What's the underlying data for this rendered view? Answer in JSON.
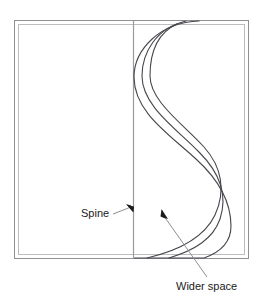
{
  "figure": {
    "type": "line-drawing-diagram",
    "background_color": "#ffffff",
    "line_color": "#3a3a40",
    "frame_color": "#8f9094",
    "frame_inner_color": "#b9babd",
    "text_color": "#1a1a1a"
  },
  "frame": {
    "name": "book-cover-outline",
    "outer": {
      "x": 14,
      "y": 20,
      "width": 235,
      "height": 239
    },
    "inner": {
      "x": 18,
      "y": 24,
      "width": 227,
      "height": 231
    }
  },
  "spine": {
    "name": "spine-line",
    "x": 133,
    "y_top": 20,
    "y_bottom": 259
  },
  "curves": [
    {
      "name": "outer-page-curve",
      "path": "M 199 21 C 158 22 134 52 134 77 C 134 112 168 134 195 158 C 217 178 231 199 231 226 C 231 241 222 252 205 258 L 134 258"
    },
    {
      "name": "middle-page-curve",
      "path": "M 186 21 C 155 27 142 53 142 76 C 142 106 176 129 198 151 C 218 171 227 194 220 218 C 214 238 196 250 170 258"
    },
    {
      "name": "inner-page-curve",
      "path": "M 177 23 C 154 33 150 56 150 76 C 150 101 182 123 203 146 C 221 166 225 190 215 214 C 204 238 178 251 148 258"
    }
  ],
  "callouts": [
    {
      "name": "spine-callout",
      "label": "Spine",
      "text_x": 81,
      "text_y": 216,
      "leader_from": {
        "x": 113,
        "y": 213
      },
      "leader_to": {
        "x": 131,
        "y": 208
      },
      "arrow_tip": {
        "x": 133,
        "y": 211
      },
      "arrow_rotation": 118
    },
    {
      "name": "wider-space-callout",
      "label": "Wider space",
      "text_x": 176,
      "text_y": 288,
      "leader_from": {
        "x": 206,
        "y": 277
      },
      "leader_to": {
        "x": 166,
        "y": 218
      },
      "arrow_tip": {
        "x": 162,
        "y": 210
      },
      "arrow_rotation": -34
    }
  ]
}
